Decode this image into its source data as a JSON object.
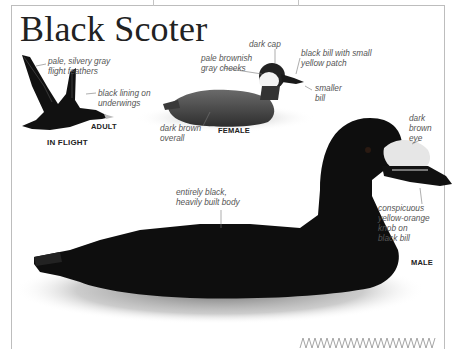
{
  "title": "Black Scoter",
  "in_flight": {
    "caption": "IN FLIGHT",
    "age_label": "ADULT",
    "annotations": [
      "pale, silvery gray\nflight feathers",
      "black lining on\nunderwings"
    ]
  },
  "female": {
    "caption": "FEMALE",
    "annotations": [
      "dark cap",
      "pale brownish\ngray cheeks",
      "black bill with small\nyellow patch",
      "smaller\nbill",
      "dark brown\noverall"
    ]
  },
  "male": {
    "caption": "MALE",
    "annotations": [
      "dark\nbrown\neye",
      "entirely black,\nheavily built body",
      "conspicuous\nyellow-orange\nknob on\nblack bill"
    ]
  },
  "colors": {
    "border": "#bdbdbd",
    "title_text": "#222222",
    "annotation_text": "#555555",
    "bird_black": "#0e0e0e",
    "female_brown": "#4a4a4a",
    "bill_knob": "#e6e6e6",
    "zigzag": "#9a9a9a"
  }
}
